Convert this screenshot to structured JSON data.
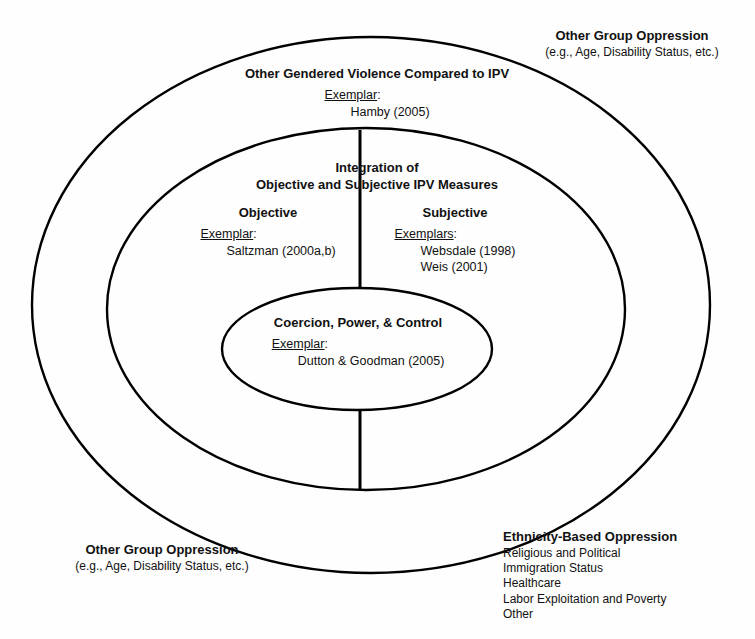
{
  "figure": {
    "stroke_color": "#000000",
    "background_color": "#ffffff"
  },
  "annotations": {
    "top_right": {
      "heading": "Other Group Oppression",
      "detail": "(e.g., Age, Disability Status, etc.)"
    },
    "bottom_left": {
      "heading": "Other Group Oppression",
      "detail": "(e.g., Age, Disability Status, etc.)"
    },
    "bottom_right": {
      "heading": "Ethnicity-Based Oppression",
      "items": [
        "Religious and Political",
        "Immigration Status",
        "Healthcare",
        "Labor Exploitation and Poverty",
        "Other"
      ]
    }
  },
  "rings": {
    "outer": {
      "heading": "Other Gendered Violence Compared to IPV",
      "exemplar_label": "Exemplar",
      "exemplar_colon": ":",
      "exemplars": [
        "Hamby (2005)"
      ]
    },
    "middle": {
      "heading_line1": "Integration of",
      "heading_line2": "Objective and Subjective IPV Measures",
      "left_column": {
        "heading": "Objective",
        "exemplar_label": "Exemplar",
        "exemplar_colon": ":",
        "exemplars": [
          "Saltzman (2000a,b)"
        ]
      },
      "right_column": {
        "heading": "Subjective",
        "exemplar_label": "Exemplars",
        "exemplar_colon": ":",
        "exemplars": [
          "Websdale (1998)",
          "Weis (2001)"
        ]
      }
    },
    "inner": {
      "heading": "Coercion, Power, & Control",
      "exemplar_label": "Exemplar",
      "exemplar_colon": ":",
      "exemplars": [
        "Dutton & Goodman (2005)"
      ]
    }
  }
}
